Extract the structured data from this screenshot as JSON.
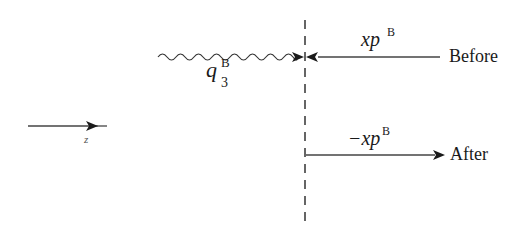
{
  "diagram": {
    "type": "momentum-flow-schematic",
    "colors": {
      "line": "#1a1a1a",
      "dashed": "#333333",
      "background": "#ffffff"
    },
    "cut_line": {
      "style": "dashed",
      "x": 305
    },
    "photon": {
      "label_base": "q",
      "label_sub": "3",
      "label_sup": "B",
      "style": "wavy"
    },
    "before": {
      "label": "Before",
      "momentum_base": "xp",
      "momentum_sup": "B",
      "direction": "left"
    },
    "after": {
      "label": "After",
      "momentum_base": "−xp",
      "momentum_sup": "B",
      "direction": "right"
    },
    "axis": {
      "label": "z",
      "direction": "right"
    }
  }
}
